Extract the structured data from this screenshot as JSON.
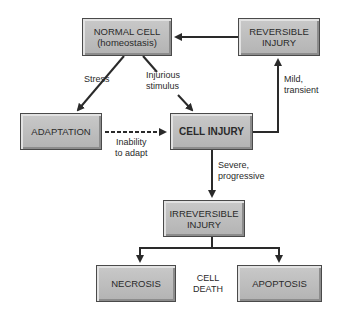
{
  "diagram": {
    "nodes": {
      "normal_cell": {
        "line1": "NORMAL CELL",
        "line2": "(homeostasis)"
      },
      "reversible_injury": {
        "line1": "REVERSIBLE",
        "line2": "INJURY"
      },
      "adaptation": {
        "line1": "ADAPTATION"
      },
      "cell_injury": {
        "line1": "CELL INJURY"
      },
      "irreversible_injury": {
        "line1": "IRREVERSIBLE",
        "line2": "INJURY"
      },
      "necrosis": {
        "line1": "NECROSIS"
      },
      "apoptosis": {
        "line1": "APOPTOSIS"
      }
    },
    "edge_labels": {
      "stress": "Stress",
      "injurious_1": "Injurious",
      "injurious_2": "stimulus",
      "inability_1": "Inability",
      "inability_2": "to adapt",
      "mild_1": "Mild,",
      "mild_2": "transient",
      "severe_1": "Severe,",
      "severe_2": "progressive",
      "cell_death_1": "CELL",
      "cell_death_2": "DEATH"
    },
    "edges": [
      {
        "from": "normal_cell",
        "to": "adaptation",
        "label": "Stress",
        "style": "solid"
      },
      {
        "from": "normal_cell",
        "to": "cell_injury",
        "label": "Injurious stimulus",
        "style": "solid"
      },
      {
        "from": "adaptation",
        "to": "cell_injury",
        "label": "Inability to adapt",
        "style": "dashed"
      },
      {
        "from": "cell_injury",
        "to": "reversible_injury",
        "label": "Mild, transient",
        "style": "solid"
      },
      {
        "from": "reversible_injury",
        "to": "normal_cell",
        "label": "",
        "style": "solid"
      },
      {
        "from": "cell_injury",
        "to": "irreversible_injury",
        "label": "Severe, progressive",
        "style": "solid"
      },
      {
        "from": "irreversible_injury",
        "to": "necrosis",
        "label": "",
        "style": "solid"
      },
      {
        "from": "irreversible_injury",
        "to": "apoptosis",
        "label": "",
        "style": "solid"
      }
    ],
    "colors": {
      "box_fill": "#bdbdbd",
      "box_border": "#4a4a4a",
      "line": "#2a2a2a"
    }
  }
}
